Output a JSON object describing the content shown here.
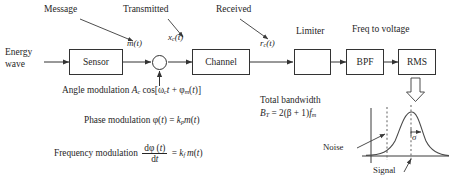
{
  "diagram": {
    "top_labels": [
      {
        "id": "message",
        "text": "Message"
      },
      {
        "id": "transmitted",
        "text": "Transmitted"
      },
      {
        "id": "received",
        "text": "Received"
      },
      {
        "id": "limiter",
        "text": "Limiter"
      },
      {
        "id": "freq-to-voltage",
        "text": "Freq to voltage"
      }
    ],
    "input_label": {
      "line1": "Energy",
      "line2": "wave"
    },
    "blocks": [
      {
        "id": "sensor",
        "label": "Sensor"
      },
      {
        "id": "channel",
        "label": "Channel"
      },
      {
        "id": "limiter",
        "label": "",
        "glyph": "square-wave"
      },
      {
        "id": "bpf",
        "label": "BPF"
      },
      {
        "id": "rms",
        "label": "RMS"
      }
    ],
    "multiplier": {
      "id": "multiplier",
      "symbol": "⊗"
    },
    "signals": [
      {
        "id": "m-t",
        "base": "m",
        "arg": "(t)",
        "sub": ""
      },
      {
        "id": "xc-t",
        "base": "x",
        "sub": "c",
        "arg": "(t)"
      },
      {
        "id": "rc-t",
        "base": "r",
        "sub": "c",
        "arg": "(t)"
      }
    ],
    "equations": {
      "angle_modulation": {
        "label": "Angle modulation",
        "expr_plain": "A_c cos[ω_c t + ϕ_m(t)]",
        "A": "A",
        "A_sub": "c",
        "cos": "cos[",
        "omega": "ω",
        "omega_sub": "c",
        "t1": "t",
        "plus": " + ",
        "phi": "ϕ",
        "phi_sub": "m",
        "t2": "(t)]"
      },
      "phase_modulation": {
        "label": "Phase modulation",
        "expr_plain": "ϕ(t) = k_p m(t)",
        "phi": "ϕ",
        "arg": "(t)",
        "eq": " = ",
        "k": "k",
        "k_sub": "p",
        "m": "m",
        "m_arg": "(t)"
      },
      "frequency_modulation": {
        "label": "Frequency modulation",
        "expr_plain": "dϕ(t)/dt = k_f m(t)",
        "num": "dϕ (t)",
        "den": "dt",
        "eq": " = ",
        "k": "k",
        "k_sub": "f",
        "m": "m",
        "m_arg": "(t)"
      },
      "total_bandwidth": {
        "label": "Total bandwidth",
        "expr_plain": "B_T = 2(β + 1)f_m",
        "B": "B",
        "B_sub": "T",
        "eq": " = ",
        "body": "2(β + 1)",
        "f": "f",
        "f_sub": "m"
      }
    },
    "plot": {
      "id": "noise-signal-distribution",
      "annotations": [
        {
          "id": "noise",
          "text": "Noise"
        },
        {
          "id": "signal",
          "text": "Signal"
        },
        {
          "id": "sigma",
          "text": "σ"
        }
      ]
    }
  }
}
